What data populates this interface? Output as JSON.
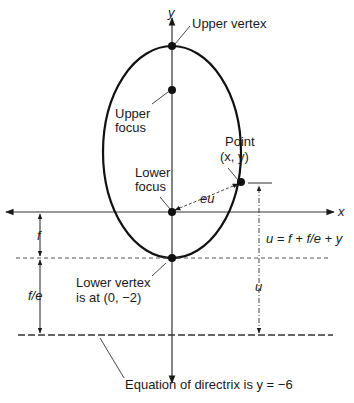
{
  "diagram": {
    "axes": {
      "x_label": "x",
      "y_label": "y"
    },
    "labels": {
      "upper_vertex": "Upper vertex",
      "upper_focus_line1": "Upper",
      "upper_focus_line2": "focus",
      "lower_focus_line1": "Lower",
      "lower_focus_line2": "focus",
      "point_line1": "Point",
      "point_line2": "(x, y)",
      "eu": "eu",
      "f": "f",
      "f_over_e": "f/e",
      "u_equation": "u = f + f/e + y",
      "u": "u",
      "lower_vertex_line1": "Lower vertex",
      "lower_vertex_line2": "is at (0, −2)",
      "directrix": "Equation of directrix is y = −6"
    },
    "colors": {
      "ink": "#1a1a1a",
      "axis": "#333333",
      "dashed": "#555555"
    }
  }
}
